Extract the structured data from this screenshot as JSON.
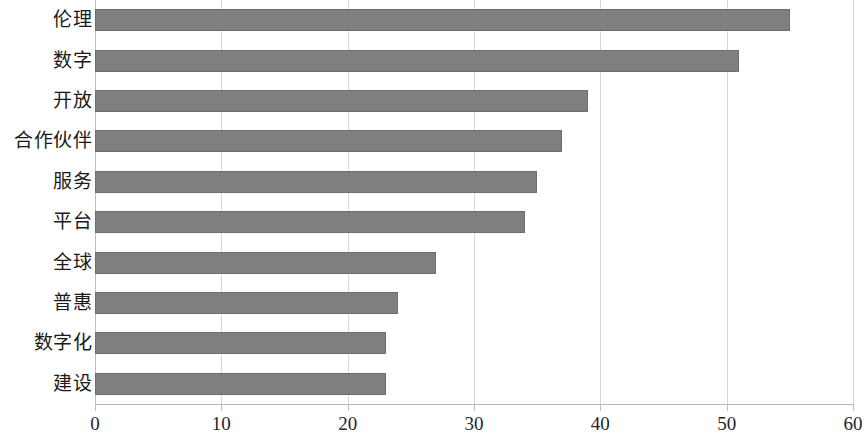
{
  "chart_data": {
    "type": "bar",
    "orientation": "horizontal",
    "title": "",
    "subtitle": "",
    "xlabel": "",
    "ylabel": "",
    "categories": [
      "伦理",
      "数字",
      "开放",
      "合作伙伴",
      "服务",
      "平台",
      "全球",
      "普惠",
      "数字化",
      "建设"
    ],
    "values": [
      55,
      51,
      39,
      37,
      35,
      34,
      27,
      24,
      23,
      23
    ],
    "series": [
      {
        "name": "频次",
        "values": [
          55,
          51,
          39,
          37,
          35,
          34,
          27,
          24,
          23,
          23
        ]
      }
    ],
    "xlim": [
      0,
      60
    ],
    "ylim": null,
    "xticks": [
      0,
      10,
      20,
      30,
      40,
      50,
      60
    ],
    "xtick_labels": [
      "0",
      "10",
      "20",
      "30",
      "40",
      "50",
      "60"
    ],
    "grid": "vertical",
    "legend": "none",
    "bar_color": "#7f7f7f",
    "bar_border_color": "#6e6e6e",
    "gridline_color": "#d9d9d9",
    "axis_color": "#b8b8b8",
    "background": "#ffffff",
    "annotations": []
  }
}
